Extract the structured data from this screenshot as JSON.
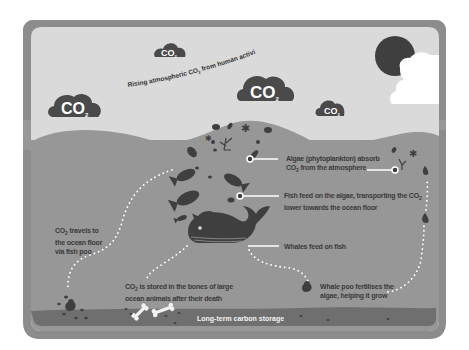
{
  "diagram": {
    "colors": {
      "frame": "#8c8c8c",
      "sky": "#dadada",
      "ocean": "#979797",
      "ocean_floor": "#6f6f6f",
      "dark_shapes": "#3f3f3f",
      "white": "#ffffff"
    },
    "sky": {
      "arc_label_prefix": "Rising atmospheric CO",
      "arc_label_sub": "2",
      "arc_label_suffix": " from human activity",
      "clouds": [
        {
          "id": "cloud-small-top",
          "text": "CO",
          "sub": "2"
        },
        {
          "id": "cloud-large-left",
          "text": "CO",
          "sub": "2"
        },
        {
          "id": "cloud-large-center",
          "text": "CO",
          "sub": "2"
        },
        {
          "id": "cloud-small-right",
          "text": "CO",
          "sub": "2"
        }
      ],
      "sun": "sun-icon"
    },
    "annotations": {
      "algae": {
        "line1": "Algae (phytoplankton) absorb",
        "line2_prefix": "CO",
        "line2_sub": "2",
        "line2_suffix": " from the atmosphere"
      },
      "fish": {
        "line1_prefix": "Fish feed on the algae, transporting the CO",
        "line1_sub": "2",
        "line2": "lower towards the ocean floor"
      },
      "whales": {
        "line1": "Whales feed on fish"
      },
      "whale_poo": {
        "line1": "Whale poo fertilises the",
        "line2": "algae, helping it grow"
      },
      "fish_poo": {
        "line1_prefix": "CO",
        "line1_sub": "2",
        "line1_suffix": " travels to",
        "line2": "the ocean floor",
        "line3": "via fish poo"
      },
      "bones": {
        "line1_prefix": "CO",
        "line1_sub": "2",
        "line1_suffix": " is stored in the bones of large",
        "line2": "ocean animals after their death"
      }
    },
    "ocean_floor": {
      "label": "Long-term carbon storage"
    }
  }
}
